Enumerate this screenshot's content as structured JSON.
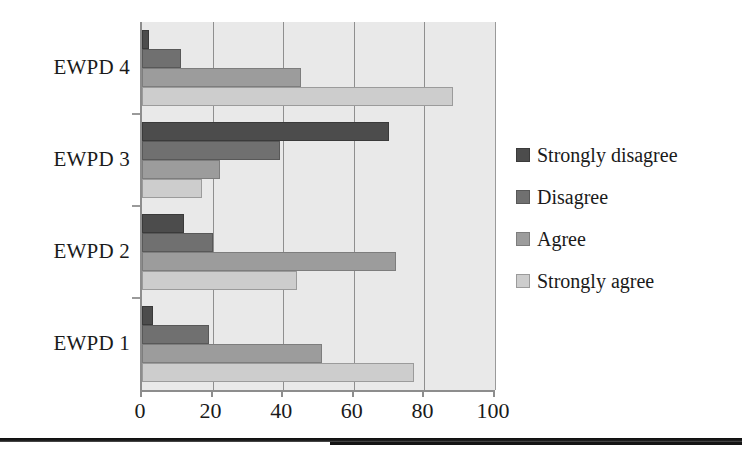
{
  "chart_data": {
    "type": "bar",
    "orientation": "horizontal",
    "title": "",
    "xlabel": "",
    "ylabel": "",
    "xlim": [
      0,
      100
    ],
    "categories": [
      "EWPD 1",
      "EWPD 2",
      "EWPD 3",
      "EWPD 4"
    ],
    "xticks": [
      "0",
      "20",
      "40",
      "60",
      "80",
      "100"
    ],
    "xtick_values": [
      0,
      20,
      40,
      60,
      80,
      100
    ],
    "grid": "vertical",
    "legend_position": "right",
    "series": [
      {
        "name": "Strongly disagree",
        "color": "#4c4c4c",
        "values": [
          3,
          12,
          70,
          2
        ]
      },
      {
        "name": "Disagree",
        "color": "#707070",
        "values": [
          19,
          20,
          39,
          11
        ]
      },
      {
        "name": "Agree",
        "color": "#9c9c9c",
        "values": [
          51,
          72,
          22,
          45
        ]
      },
      {
        "name": "Strongly agree",
        "color": "#cdcdcd",
        "values": [
          77,
          44,
          17,
          88
        ]
      }
    ],
    "plot_background": "#e9e9e9",
    "axis_color": "#8d8d8d"
  },
  "legend": {
    "items": [
      {
        "label": "Strongly disagree"
      },
      {
        "label": "Disagree"
      },
      {
        "label": "Agree"
      },
      {
        "label": "Strongly agree"
      }
    ]
  }
}
